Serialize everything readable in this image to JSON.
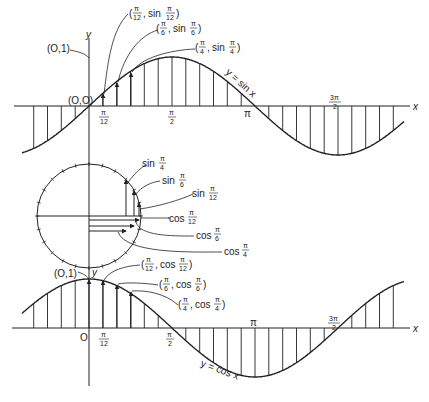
{
  "figure": {
    "top_graph": {
      "curve_label": "y = sin x",
      "axis_x": "x",
      "axis_y": "y",
      "origin_label": "(O,O)",
      "y_intercept_label": "(O,1)",
      "ticks": [
        {
          "num": "π",
          "den": "12"
        },
        {
          "num": "π",
          "den": "2"
        },
        {
          "label": "π"
        },
        {
          "num": "3π",
          "den": "2"
        }
      ],
      "annotations": [
        {
          "text": "(π/12, sin π/12)"
        },
        {
          "text": "(π/6, sin π/6)"
        },
        {
          "text": "(π/4, sin π/4)"
        }
      ]
    },
    "unit_circle": {
      "labels": [
        {
          "text": "sin",
          "frac_num": "π",
          "frac_den": "4"
        },
        {
          "text": "sin",
          "frac_num": "π",
          "frac_den": "6"
        },
        {
          "text": "sin",
          "frac_num": "π",
          "frac_den": "12"
        },
        {
          "text": "cos",
          "frac_num": "π",
          "frac_den": "12"
        },
        {
          "text": "cos",
          "frac_num": "π",
          "frac_den": "6"
        },
        {
          "text": "cos",
          "frac_num": "π",
          "frac_den": "4"
        }
      ]
    },
    "bottom_graph": {
      "curve_label": "y = cos x",
      "axis_x": "x",
      "axis_y": "y",
      "origin_label": "O",
      "y_intercept_label": "(O,1)",
      "ticks": [
        {
          "num": "π",
          "den": "12"
        },
        {
          "num": "π",
          "den": "2"
        },
        {
          "label": "π"
        },
        {
          "num": "3π",
          "den": "2"
        }
      ],
      "annotations": [
        {
          "text": "(π/12, cos π/12)"
        },
        {
          "text": "(π/6, cos π/6)"
        },
        {
          "text": "(π/4, cos π/4)"
        }
      ]
    }
  },
  "labels": {
    "top_origin": "(O,O)",
    "top_yint": "(O,1)",
    "top_y": "y",
    "top_x": "x",
    "top_curve": "y = sin x",
    "pi": "π",
    "twelve": "12",
    "two": "2",
    "three_pi": "3π",
    "ann_s12_a": "(",
    "ann_s12": "sin",
    "ann_s6": "sin",
    "ann_s4": "sin",
    "ann_c12": "cos",
    "ann_c6": "cos",
    "ann_c4": "cos",
    "six": "6",
    "four": "4",
    "bot_origin": "O",
    "bot_yint": "(O,1)",
    "bot_y": "y",
    "bot_x": "x",
    "bot_curve": "y = cos x",
    "circ_sin": "sin",
    "circ_cos": "cos"
  }
}
